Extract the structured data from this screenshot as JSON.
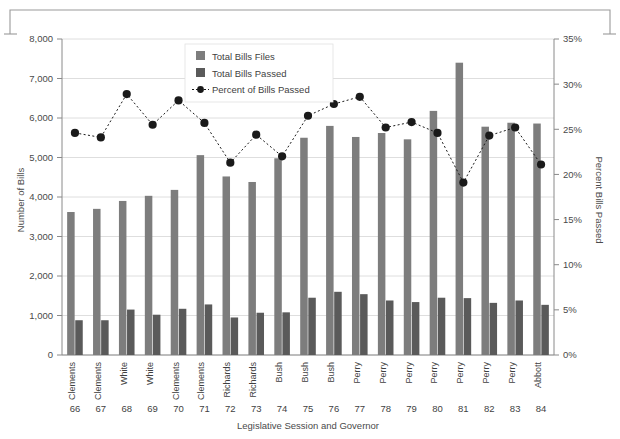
{
  "chart_data": {
    "type": "bar",
    "title": "",
    "subtitle": "",
    "xlabel": "Legislative Session and Governor",
    "ylabel": "Number of Bills",
    "y2label": "Percent Bills Passed",
    "grid": true,
    "legend_position": "top-center",
    "ylim": [
      0,
      8000
    ],
    "y2lim": [
      0,
      0.35
    ],
    "yticks": [
      "0",
      "1,000",
      "2,000",
      "3,000",
      "4,000",
      "5,000",
      "6,000",
      "7,000",
      "8,000"
    ],
    "ytick_values": [
      0,
      1000,
      2000,
      3000,
      4000,
      5000,
      6000,
      7000,
      8000
    ],
    "y2ticks": [
      "0%",
      "5%",
      "10%",
      "15%",
      "20%",
      "25%",
      "30%",
      "35%"
    ],
    "y2tick_values": [
      0,
      5,
      10,
      15,
      20,
      25,
      30,
      35
    ],
    "categories": [
      "66",
      "67",
      "68",
      "69",
      "70",
      "71",
      "72",
      "73",
      "74",
      "75",
      "76",
      "77",
      "78",
      "79",
      "80",
      "81",
      "82",
      "83",
      "84"
    ],
    "governors": [
      "Clements",
      "Clements",
      "White",
      "White",
      "Clements",
      "Clements",
      "Richards",
      "Richards",
      "Bush",
      "Bush",
      "Bush",
      "Perry",
      "Perry",
      "Perry",
      "Perry",
      "Perry",
      "Perry",
      "Perry",
      "Abbott"
    ],
    "series": [
      {
        "name": "Total Bills Files",
        "kind": "bar",
        "color": "#7d7d7d",
        "values": [
          3620,
          3700,
          3900,
          4030,
          4180,
          5060,
          4520,
          4380,
          4980,
          5500,
          5800,
          5520,
          5620,
          5460,
          6180,
          7400,
          5780,
          5880,
          5860
        ]
      },
      {
        "name": "Total Bills Passed",
        "kind": "bar",
        "color": "#5a5a5a",
        "values": [
          880,
          880,
          1150,
          1020,
          1170,
          1280,
          950,
          1070,
          1080,
          1450,
          1600,
          1540,
          1380,
          1340,
          1450,
          1440,
          1320,
          1380,
          1270
        ]
      },
      {
        "name": "Percent of Bills Passed",
        "kind": "line",
        "color": "#1a1a1a",
        "axis": "right",
        "values": [
          24.6,
          24.1,
          28.9,
          25.5,
          28.2,
          25.7,
          21.3,
          24.4,
          22.0,
          26.5,
          27.8,
          28.6,
          25.2,
          25.8,
          24.6,
          19.1,
          24.3,
          25.2,
          21.1
        ]
      }
    ]
  },
  "legend": {
    "items": [
      {
        "label": "Total Bills Files",
        "type": "swatch",
        "color": "#7d7d7d"
      },
      {
        "label": "Total Bills Passed",
        "type": "swatch",
        "color": "#5a5a5a"
      },
      {
        "label": "Percent of Bills Passed",
        "type": "line-marker",
        "color": "#1a1a1a"
      }
    ]
  }
}
